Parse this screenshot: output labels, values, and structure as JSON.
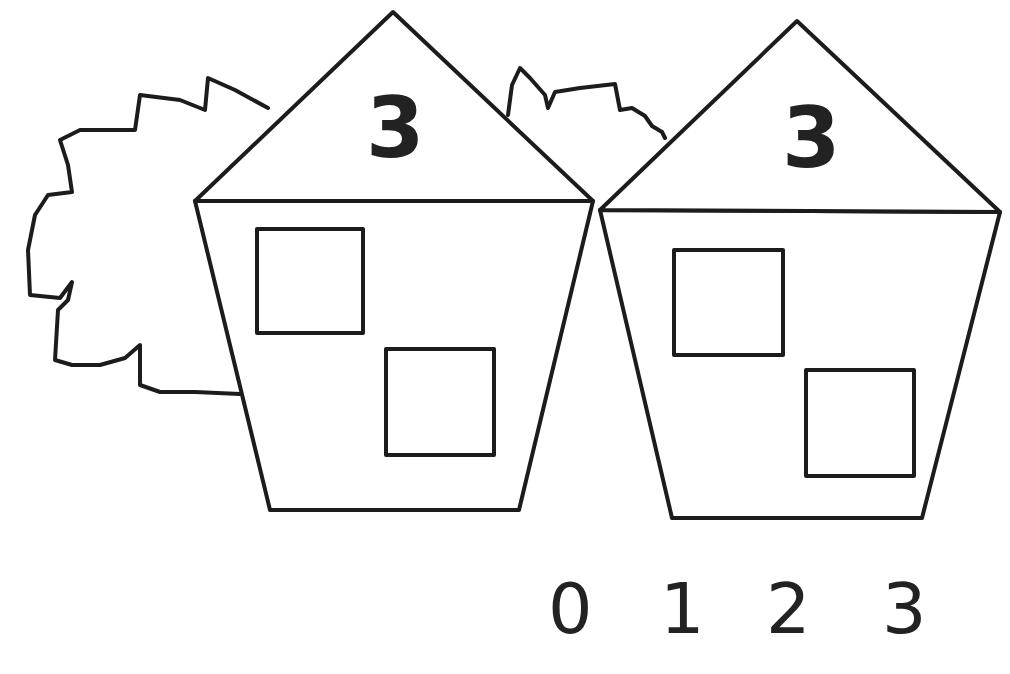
{
  "worksheet": {
    "houses": [
      {
        "roof_number": "3",
        "windows": 2
      },
      {
        "roof_number": "3",
        "windows": 2
      }
    ],
    "answer_choices": [
      "0",
      "1",
      "2",
      "3"
    ]
  },
  "colors": {
    "ink": "#1c1c1c",
    "paper": "#ffffff"
  }
}
